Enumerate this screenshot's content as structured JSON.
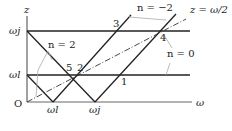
{
  "axes": {
    "z_label": "z",
    "omega_label": "ω",
    "origin_label": "O"
  },
  "ticks": {
    "omega_j_y": "ωj",
    "omega_l_y": "ωl",
    "omega_l_x": "ωl",
    "omega_j_x": "ωj"
  },
  "annotations": {
    "n_pos2": "n = 2",
    "n_neg2": "n = −2",
    "n_zero": "n = 0",
    "z_half": "z = ω/2"
  },
  "points": [
    "1",
    "2",
    "3",
    "4",
    "5"
  ],
  "colors": {
    "line": "#222222",
    "leader": "#999999"
  }
}
